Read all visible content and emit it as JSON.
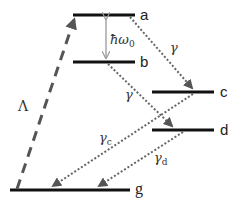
{
  "diagram": {
    "colors": {
      "level_line": "#111111",
      "pump_arrow": "#555555",
      "decay_arrow": "#666666",
      "splitting_arrow": "#999999",
      "text": "#222222"
    },
    "levels": [
      {
        "id": "a",
        "label": "a",
        "x1": 73,
        "x2": 135,
        "y": 15
      },
      {
        "id": "b",
        "label": "b",
        "x1": 73,
        "x2": 135,
        "y": 62
      },
      {
        "id": "c",
        "label": "c",
        "x1": 152,
        "x2": 214,
        "y": 92
      },
      {
        "id": "d",
        "label": "d",
        "x1": 152,
        "x2": 214,
        "y": 130
      },
      {
        "id": "g",
        "label": "g",
        "x1": 10,
        "x2": 130,
        "y": 190
      }
    ],
    "labels": {
      "a": "a",
      "b": "b",
      "c": "c",
      "d": "d",
      "g": "g",
      "pump": "Λ",
      "splitting_hbar": "ħω",
      "splitting_sub": "0",
      "gamma_ac": "γ",
      "gamma_bd": "γ",
      "gamma_c": "γ",
      "gamma_c_sub": "c",
      "gamma_d": "γ",
      "gamma_d_sub": "d"
    },
    "transitions": [
      {
        "id": "pump",
        "from": "g",
        "to": "a",
        "style": "dashed",
        "label": "Λ"
      },
      {
        "id": "splitting",
        "from": "a",
        "to": "b",
        "style": "double-arrow",
        "label": "ħω0"
      },
      {
        "id": "decay_ac",
        "from": "a",
        "to": "c",
        "style": "dotted",
        "label": "γ"
      },
      {
        "id": "decay_bd",
        "from": "b",
        "to": "d",
        "style": "dotted",
        "label": "γ"
      },
      {
        "id": "decay_cg",
        "from": "c",
        "to": "g",
        "style": "dotted",
        "label": "γc"
      },
      {
        "id": "decay_dg",
        "from": "d",
        "to": "g",
        "style": "dotted",
        "label": "γd"
      }
    ]
  }
}
